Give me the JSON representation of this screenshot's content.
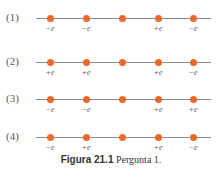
{
  "rows": [
    {
      "label": "(1)",
      "charges": [
        "−e",
        "−e",
        "",
        "+e",
        "−e"
      ]
    },
    {
      "label": "(2)",
      "charges": [
        "+e",
        "+e",
        "",
        "+e",
        "−e"
      ]
    },
    {
      "label": "(3)",
      "charges": [
        "−e",
        "−e",
        "",
        "+e",
        "+e"
      ]
    },
    {
      "label": "(4)",
      "charges": [
        "−e",
        "+e",
        "",
        "+e",
        "−e"
      ]
    }
  ],
  "colors": {
    "dot": "#e8692a",
    "line": "#8a8a8a"
  },
  "caption": {
    "bold": "Figura 21.1",
    "text": "Pergunta 1."
  }
}
